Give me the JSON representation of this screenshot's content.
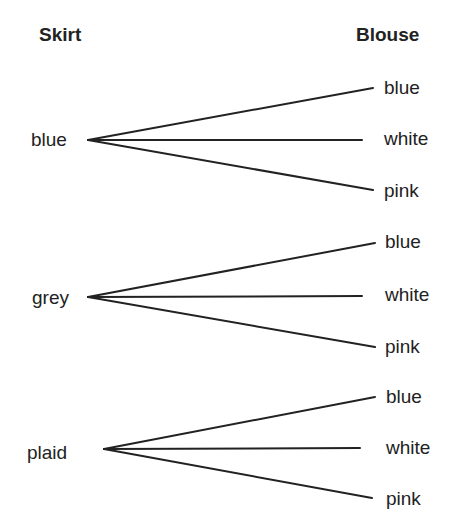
{
  "headers": {
    "left": "Skirt",
    "right": "Blouse"
  },
  "skirts": [
    {
      "label": "blue",
      "blouses": [
        "blue",
        "white",
        "pink"
      ]
    },
    {
      "label": "grey",
      "blouses": [
        "blue",
        "white",
        "pink"
      ]
    },
    {
      "label": "plaid",
      "blouses": [
        "blue",
        "white",
        "pink"
      ]
    }
  ],
  "colors": {
    "ink": "#222222",
    "background": "#ffffff"
  }
}
